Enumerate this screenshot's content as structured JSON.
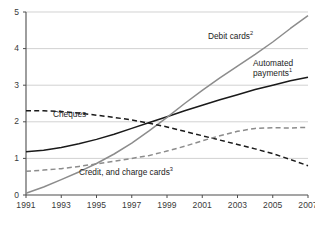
{
  "chart_data": {
    "type": "line",
    "title": "",
    "xlabel": "",
    "ylabel": "",
    "xlim": [
      1991,
      2007
    ],
    "ylim": [
      0,
      5
    ],
    "grid": true,
    "legend_position": "inline-labels",
    "x": [
      1991,
      1992,
      1993,
      1994,
      1995,
      1996,
      1997,
      1998,
      1999,
      2000,
      2001,
      2002,
      2003,
      2004,
      2005,
      2006,
      2007
    ],
    "xticks": [
      "1991",
      "1993",
      "1995",
      "1997",
      "1999",
      "2001",
      "2003",
      "2005",
      "2007"
    ],
    "yticks": [
      "0",
      "1",
      "2",
      "3",
      "4",
      "5"
    ],
    "series": [
      {
        "name": "Automated payments",
        "label": "Automated payments",
        "superscript": "1",
        "style": "solid",
        "color": "#1a1a1a",
        "values": [
          1.18,
          1.22,
          1.3,
          1.4,
          1.52,
          1.66,
          1.82,
          1.98,
          2.14,
          2.3,
          2.45,
          2.6,
          2.74,
          2.88,
          3.0,
          3.12,
          3.22
        ]
      },
      {
        "name": "Debit cards",
        "label": "Debit cards",
        "superscript": "2",
        "style": "solid",
        "color": "#8c8c8c",
        "values": [
          0.05,
          0.22,
          0.42,
          0.63,
          0.86,
          1.12,
          1.42,
          1.76,
          2.12,
          2.5,
          2.86,
          3.2,
          3.52,
          3.84,
          4.18,
          4.55,
          4.9
        ]
      },
      {
        "name": "Cheques",
        "label": "Cheques",
        "superscript": "",
        "style": "dashed",
        "color": "#1a1a1a",
        "values": [
          2.3,
          2.3,
          2.28,
          2.24,
          2.18,
          2.12,
          2.05,
          1.96,
          1.86,
          1.74,
          1.62,
          1.5,
          1.38,
          1.26,
          1.13,
          0.97,
          0.8
        ]
      },
      {
        "name": "Credit, and charge cards",
        "label": "Credit, and charge cards",
        "superscript": "3",
        "style": "dashed",
        "color": "#8c8c8c",
        "values": [
          0.65,
          0.68,
          0.72,
          0.78,
          0.85,
          0.92,
          1.0,
          1.08,
          1.2,
          1.33,
          1.48,
          1.62,
          1.74,
          1.82,
          1.84,
          1.83,
          1.85
        ]
      }
    ]
  },
  "axis": {
    "y_labels": [
      "5",
      "4",
      "3",
      "2",
      "1",
      "0"
    ],
    "x_labels": [
      "1991",
      "1993",
      "1995",
      "1997",
      "1999",
      "2001",
      "2003",
      "2005",
      "2007"
    ]
  },
  "labels": {
    "debit_cards": "Debit cards",
    "debit_cards_sup": "2",
    "automated_line1": "Automated",
    "automated_line2": "payments",
    "automated_sup": "1",
    "cheques": "Cheques",
    "credit_cards": "Credit, and charge cards",
    "credit_cards_sup": "3"
  },
  "colors": {
    "dark_line": "#1a1a1a",
    "gray_line": "#8c8c8c",
    "grid": "#bfbfbf",
    "axis": "#4d4d4d",
    "text": "#3a3a3a",
    "background": "#ffffff"
  }
}
